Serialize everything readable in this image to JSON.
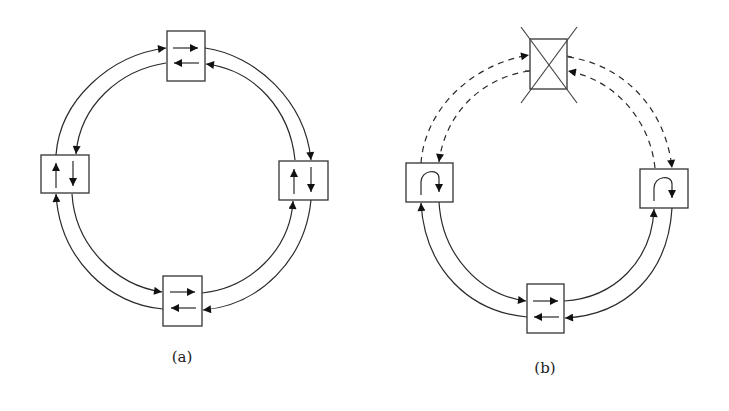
{
  "figure": {
    "panels": [
      {
        "id": "a",
        "label": "(a)",
        "description": "Ring of four nodes with dual counter-rotating links, all links active",
        "nodes": [
          {
            "position": "top",
            "inner_arrows": [
              "right",
              "left"
            ]
          },
          {
            "position": "left",
            "inner_arrows": [
              "up",
              "down"
            ]
          },
          {
            "position": "right",
            "inner_arrows": [
              "up",
              "down"
            ]
          },
          {
            "position": "bottom",
            "inner_arrows": [
              "right",
              "left"
            ]
          }
        ],
        "link_style": "solid"
      },
      {
        "id": "b",
        "label": "(b)",
        "description": "Ring with failed top node; neighbours loop back traffic",
        "nodes": [
          {
            "position": "top",
            "state": "failed",
            "marker": "crossed-out"
          },
          {
            "position": "left",
            "inner_arrows": [
              "loopback"
            ]
          },
          {
            "position": "right",
            "inner_arrows": [
              "loopback"
            ]
          },
          {
            "position": "bottom",
            "inner_arrows": [
              "right",
              "left"
            ]
          }
        ],
        "link_style_to_failed_node": "dashed",
        "link_style_other": "solid"
      }
    ]
  },
  "colors": {
    "stroke": "#2a2a2a",
    "background": "#ffffff"
  }
}
